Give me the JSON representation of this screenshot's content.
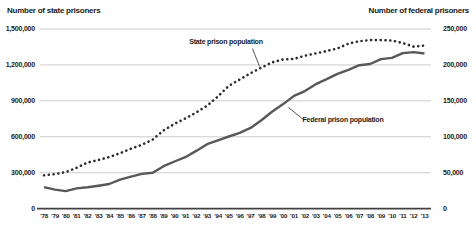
{
  "annotations": {
    "state_label": "State prison population",
    "federal_label": "Federal prison population"
  },
  "colors": {
    "background": "#ffffff",
    "grid": "#c6c6c6",
    "axis": "#414141",
    "text": "#1a1a1a",
    "state_line": "#2c2c2c",
    "federal_line": "#585858",
    "callout": "#2c2c2c"
  },
  "chart_data": {
    "type": "line",
    "x": [
      "’78",
      "’79",
      "’80",
      "’81",
      "’82",
      "’83",
      "’84",
      "’85",
      "’86",
      "’87",
      "’88",
      "’89",
      "’90",
      "’91",
      "’92",
      "’93",
      "’94",
      "’95",
      "’96",
      "’97",
      "’98",
      "’99",
      "’00",
      "’01",
      "’02",
      "’03",
      "’04",
      "’05",
      "’06",
      "’07",
      "’08",
      "’09",
      "’10",
      "’11",
      "’12",
      "’13"
    ],
    "series": [
      {
        "name": "State prison population",
        "axis": "left",
        "style": "dotted",
        "color": "#2c2c2c",
        "values": [
          278000,
          288000,
          305000,
          341000,
          384000,
          406000,
          430000,
          463000,
          500000,
          533000,
          577000,
          653000,
          708000,
          753000,
          803000,
          859000,
          936000,
          1026000,
          1078000,
          1131000,
          1178000,
          1222000,
          1246000,
          1250000,
          1277000,
          1296000,
          1316000,
          1338000,
          1377000,
          1398000,
          1407000,
          1407000,
          1404000,
          1382000,
          1353000,
          1361000
        ]
      },
      {
        "name": "Federal prison population",
        "axis": "right",
        "style": "solid",
        "color": "#585858",
        "values": [
          29800,
          26400,
          24400,
          28100,
          29700,
          31900,
          34300,
          40200,
          44400,
          48300,
          49900,
          59000,
          65500,
          71600,
          80300,
          89600,
          95000,
          100300,
          105500,
          112300,
          123000,
          135200,
          145400,
          156900,
          163500,
          173100,
          180300,
          187600,
          193000,
          199600,
          201300,
          208100,
          209800,
          216400,
          217800,
          215900
        ]
      }
    ],
    "left_axis": {
      "title": "Number of state prisoners",
      "range": [
        0,
        1500000
      ],
      "tick_labels": [
        "0",
        "300,000",
        "600,000",
        "900,000",
        "1,200,000",
        "1,500,000"
      ]
    },
    "right_axis": {
      "title": "Number of federal prisoners",
      "range": [
        0,
        250000
      ],
      "tick_labels": [
        "0",
        "50,000",
        "100,000",
        "150,000",
        "200,000",
        "250,000"
      ]
    },
    "grid": true,
    "legend_position": "inline-annotations"
  }
}
